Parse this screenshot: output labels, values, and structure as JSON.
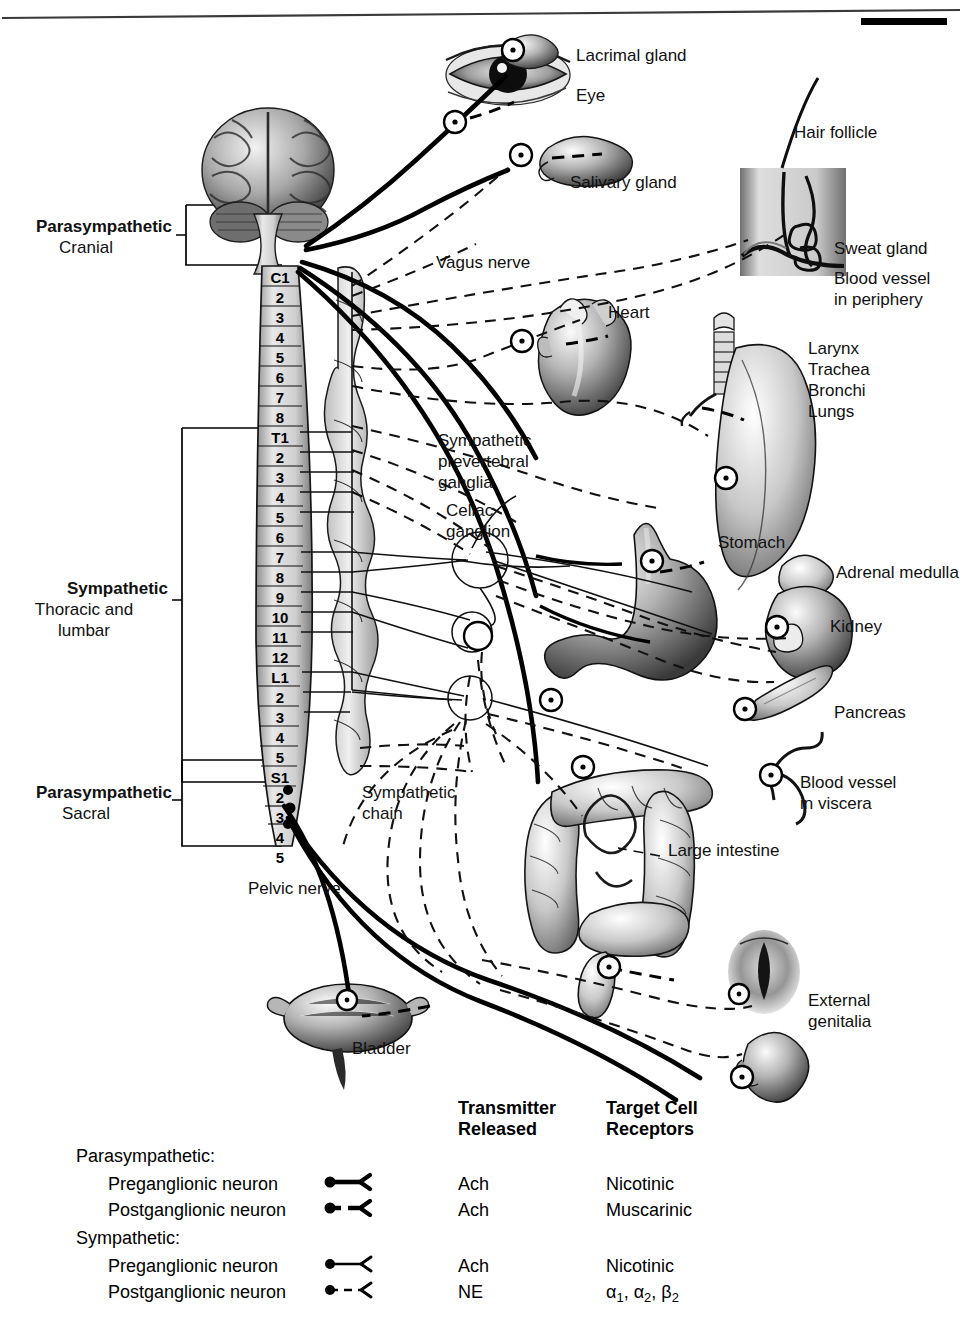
{
  "divisions": [
    {
      "name": "parasympathetic-cranial",
      "bold_label": "Parasympathetic",
      "sub_label": "Cranial"
    },
    {
      "name": "sympathetic-thoracolumbar",
      "bold_label": "Sympathetic",
      "sub_label": "Thoracic and",
      "sub_label2": "lumbar"
    },
    {
      "name": "parasympathetic-sacral",
      "bold_label": "Parasympathetic",
      "sub_label": "Sacral"
    }
  ],
  "spinal_segments": [
    "C1",
    "2",
    "3",
    "4",
    "5",
    "6",
    "7",
    "8",
    "T1",
    "2",
    "3",
    "4",
    "5",
    "6",
    "7",
    "8",
    "9",
    "10",
    "11",
    "12",
    "L1",
    "2",
    "3",
    "4",
    "5",
    "S1",
    "2",
    "3",
    "4",
    "5"
  ],
  "organ_labels": [
    {
      "name": "lacrimal-gland",
      "text": "Lacrimal gland"
    },
    {
      "name": "eye",
      "text": "Eye"
    },
    {
      "name": "salivary-gland",
      "text": "Salivary gland"
    },
    {
      "name": "hair-follicle",
      "text": "Hair follicle"
    },
    {
      "name": "sweat-gland",
      "text": "Sweat gland"
    },
    {
      "name": "blood-vessel-periphery",
      "text": "Blood vessel\nin periphery"
    },
    {
      "name": "heart",
      "text": "Heart"
    },
    {
      "name": "airways",
      "text": "Larynx\nTrachea\nBronchi\nLungs"
    },
    {
      "name": "stomach",
      "text": "Stomach"
    },
    {
      "name": "adrenal-medulla",
      "text": "Adrenal medulla"
    },
    {
      "name": "kidney",
      "text": "Kidney"
    },
    {
      "name": "pancreas",
      "text": "Pancreas"
    },
    {
      "name": "blood-vessel-viscera",
      "text": "Blood vessel\nin viscera"
    },
    {
      "name": "large-intestine",
      "text": "Large intestine"
    },
    {
      "name": "external-genitalia",
      "text": "External\ngenitalia"
    },
    {
      "name": "bladder",
      "text": "Bladder"
    }
  ],
  "nerve_labels": [
    {
      "name": "vagus-nerve",
      "text": "Vagus nerve"
    },
    {
      "name": "sympathetic-prevertebral-ganglia",
      "text": "Sympathetic\nprevertebral\nganglia"
    },
    {
      "name": "celiac-ganglion",
      "text": "Celiac\nganglion"
    },
    {
      "name": "sympathetic-chain",
      "text": "Sympathetic\nchain"
    },
    {
      "name": "pelvic-nerve",
      "text": "Pelvic nerve"
    }
  ],
  "legend": {
    "columns": [
      {
        "name": "transmitter-released",
        "line1": "Transmitter",
        "line2": "Released"
      },
      {
        "name": "target-cell-receptors",
        "line1": "Target Cell",
        "line2": "Receptors"
      }
    ],
    "groups": [
      {
        "name": "parasympathetic-group",
        "heading": "Parasympathetic:",
        "rows": [
          {
            "name": "para-preganglionic",
            "label": "Preganglionic neuron",
            "symbol": "thick-solid-arrow",
            "transmitter": "Ach",
            "receptor": "Nicotinic"
          },
          {
            "name": "para-postganglionic",
            "label": "Postganglionic neuron",
            "symbol": "thick-dashed-arrow",
            "transmitter": "Ach",
            "receptor": "Muscarinic"
          }
        ]
      },
      {
        "name": "sympathetic-group",
        "heading": "Sympathetic:",
        "rows": [
          {
            "name": "symp-preganglionic",
            "label": "Preganglionic neuron",
            "symbol": "thin-solid-arrow",
            "transmitter": "Ach",
            "receptor": "Nicotinic"
          },
          {
            "name": "symp-postganglionic",
            "label": "Postganglionic neuron",
            "symbol": "thin-dashed-arrow",
            "transmitter": "NE",
            "receptor_alpha1": "α",
            "receptor_sub1": "1",
            "receptor_alpha2": "α",
            "receptor_sub2": "2",
            "receptor_beta": "β",
            "receptor_sub3": "2",
            "receptor": "α1, α2, β2"
          }
        ]
      }
    ]
  },
  "colors": {
    "ink": "#000000",
    "paper": "#ffffff",
    "tissue_mid": "#9a9a9a",
    "tissue_light": "#cdcdcd",
    "tissue_dark": "#4a4a4a"
  }
}
